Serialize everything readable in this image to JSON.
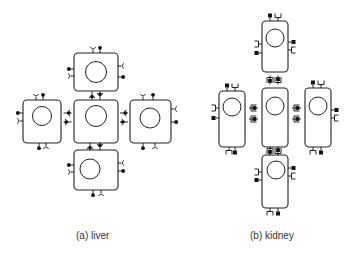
{
  "figure": {
    "panels": [
      {
        "id": "a",
        "caption": "(a) liver",
        "cell_shape": "rounded-square",
        "arrangement": "cross of 5 cells",
        "cells": [
          "top",
          "left",
          "center",
          "right",
          "bottom"
        ],
        "receptor_glyphs": [
          "round-dot-stalk",
          "Y-cup-stalk"
        ]
      },
      {
        "id": "b",
        "caption": "(b) kidney",
        "cell_shape": "tall-rounded-rectangle",
        "arrangement": "cross of 5 cells",
        "cells": [
          "top",
          "left",
          "center",
          "right",
          "bottom"
        ],
        "receptor_glyphs": [
          "square-dot-stalk",
          "square-cup-stalk"
        ]
      }
    ]
  }
}
